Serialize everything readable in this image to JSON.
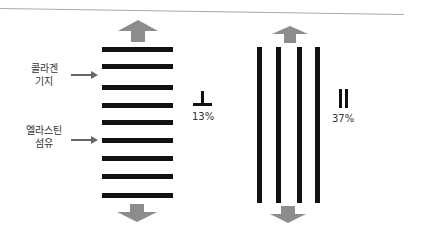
{
  "diagram": {
    "left_panel": {
      "labels": [
        {
          "text_line1": "콜라겐",
          "text_line2": "기지"
        },
        {
          "text_line1": "엘라스틴",
          "text_line2": "섬유"
        }
      ],
      "orientation_symbol": "perpendicular-icon",
      "percentage": "13%",
      "bar_count": 9,
      "bar_orientation": "horizontal"
    },
    "right_panel": {
      "orientation_symbol": "parallel-icon",
      "percentage": "37%",
      "bar_count": 4,
      "bar_orientation": "vertical"
    },
    "colors": {
      "bars": "#111111",
      "arrows": "#8c8c8c",
      "label_arrows": "#666666",
      "text": "#333333"
    }
  }
}
